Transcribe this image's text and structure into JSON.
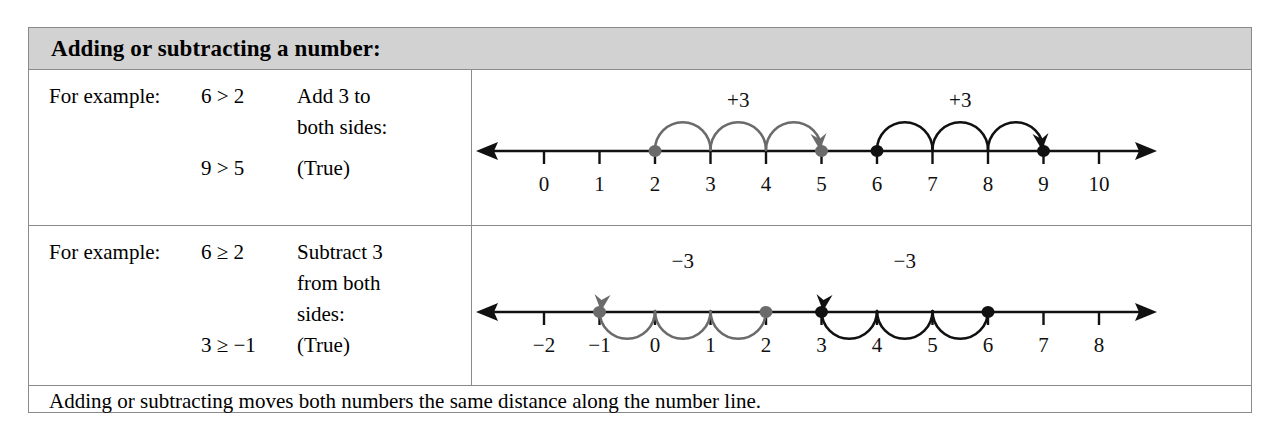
{
  "header": {
    "title": "Adding or subtracting a number:"
  },
  "colors": {
    "header_band": "#d2d2d2",
    "border": "#8a8a8a",
    "axis": "#111111",
    "gray_accent": "#6b6b6b",
    "black_accent": "#111111"
  },
  "rows": [
    {
      "lead": "For example:",
      "inequality_1": "6 > 2",
      "instruction_line_1": "Add 3 to",
      "instruction_line_2": "both sides:",
      "inequality_2": "9 > 5",
      "result": "(True)"
    },
    {
      "lead": "For example:",
      "inequality_1": "6 ≥ 2",
      "instruction_line_1": "Subtract 3",
      "instruction_line_2": "from both",
      "instruction_line_3": "sides:",
      "inequality_2": "3 ≥ −1",
      "result": "(True)"
    }
  ],
  "footer": {
    "text": "Adding or subtracting moves both numbers the same distance along the number line."
  },
  "chart_data": [
    {
      "type": "number-line",
      "title": "",
      "axis_min": 0,
      "axis_max": 10,
      "tick_labels": [
        "0",
        "1",
        "2",
        "3",
        "4",
        "5",
        "6",
        "7",
        "8",
        "9",
        "10"
      ],
      "left_arrow": true,
      "right_arrow": true,
      "points": [
        {
          "value": 2,
          "color": "#6b6b6b"
        },
        {
          "value": 5,
          "color": "#6b6b6b"
        },
        {
          "value": 6,
          "color": "#111111"
        },
        {
          "value": 9,
          "color": "#111111"
        }
      ],
      "jumps": [
        {
          "from": 2,
          "to": 5,
          "step": 1,
          "direction": "right",
          "label": "+3",
          "color": "#6b6b6b"
        },
        {
          "from": 6,
          "to": 9,
          "step": 1,
          "direction": "right",
          "label": "+3",
          "color": "#111111"
        }
      ]
    },
    {
      "type": "number-line",
      "title": "",
      "axis_min": -2,
      "axis_max": 8,
      "tick_labels": [
        "−2",
        "−1",
        "0",
        "1",
        "2",
        "3",
        "4",
        "5",
        "6",
        "7",
        "8"
      ],
      "left_arrow": true,
      "right_arrow": true,
      "points": [
        {
          "value": -1,
          "color": "#6b6b6b"
        },
        {
          "value": 2,
          "color": "#6b6b6b"
        },
        {
          "value": 3,
          "color": "#111111"
        },
        {
          "value": 6,
          "color": "#111111"
        }
      ],
      "jumps": [
        {
          "from": 2,
          "to": -1,
          "step": 1,
          "direction": "left",
          "label": "−3",
          "color": "#6b6b6b"
        },
        {
          "from": 6,
          "to": 3,
          "step": 1,
          "direction": "left",
          "label": "−3",
          "color": "#111111"
        }
      ]
    }
  ]
}
